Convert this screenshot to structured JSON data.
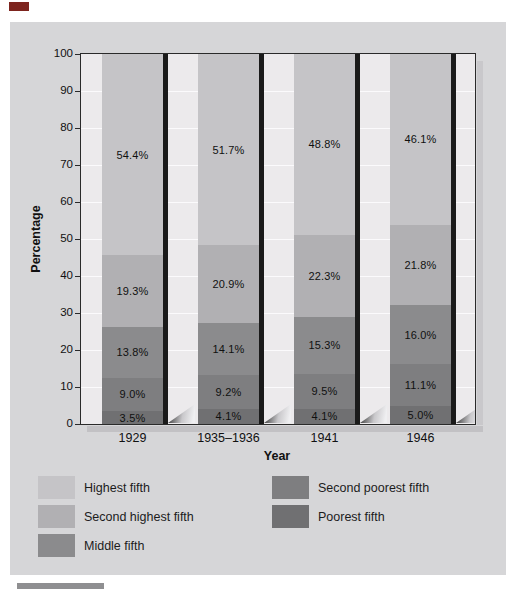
{
  "figure": {
    "top_marker_color": "#7d241e",
    "bottom_rule_color": "#8f8f91",
    "panel_bg": "#d6d6d8",
    "plot_bg": "#eceaec"
  },
  "chart_data": {
    "type": "bar",
    "stacked": true,
    "title": "",
    "xlabel": "Year",
    "ylabel": "Percentage",
    "ylim": [
      0,
      100
    ],
    "yticks": [
      0,
      10,
      20,
      30,
      40,
      50,
      60,
      70,
      80,
      90,
      100
    ],
    "grid": "horizontal-white-lines",
    "categories": [
      "1929",
      "1935–1936",
      "1941",
      "1946"
    ],
    "series": [
      {
        "name": "Poorest fifth",
        "color": "#707072",
        "values": [
          3.5,
          4.1,
          4.1,
          5.0
        ],
        "labels": [
          "3.5%",
          "4.1%",
          "4.1%",
          "5.0%"
        ]
      },
      {
        "name": "Second poorest fifth",
        "color": "#7e7e80",
        "values": [
          9.0,
          9.2,
          9.5,
          11.1
        ],
        "labels": [
          "9.0%",
          "9.2%",
          "9.5%",
          "11.1%"
        ]
      },
      {
        "name": "Middle fifth",
        "color": "#8b8b8d",
        "values": [
          13.8,
          14.1,
          15.3,
          16.0
        ],
        "labels": [
          "13.8%",
          "14.1%",
          "15.3%",
          "16.0%"
        ]
      },
      {
        "name": "Second highest fifth",
        "color": "#b1b0b3",
        "values": [
          19.3,
          20.9,
          22.3,
          21.8
        ],
        "labels": [
          "19.3%",
          "20.9%",
          "22.3%",
          "21.8%"
        ]
      },
      {
        "name": "Highest fifth",
        "color": "#c5c4c7",
        "values": [
          54.4,
          51.7,
          48.8,
          46.1
        ],
        "labels": [
          "54.4%",
          "51.7%",
          "48.8%",
          "46.1%"
        ]
      }
    ],
    "legend": {
      "position": "bottom",
      "columns": [
        [
          "Highest fifth",
          "Second highest fifth",
          "Middle fifth"
        ],
        [
          "Second poorest fifth",
          "Poorest fifth"
        ]
      ]
    }
  }
}
